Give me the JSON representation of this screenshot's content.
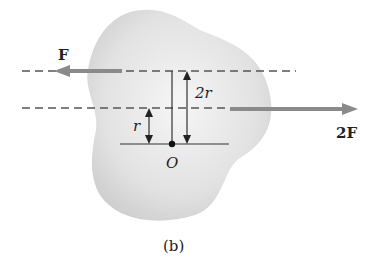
{
  "figure": {
    "caption": "(b)",
    "body": {
      "fill_inner": "#f4f4f4",
      "fill_outer": "#d2d2d2"
    },
    "forces": [
      {
        "label": "F",
        "direction": "left",
        "color": "#8a8a8a"
      },
      {
        "label": "2F",
        "direction": "right",
        "color": "#8a8a8a"
      }
    ],
    "dimensions": [
      {
        "label": "r"
      },
      {
        "label": "2r"
      }
    ],
    "point": {
      "label": "O"
    },
    "line_color": "#333333",
    "dash_color": "#555555"
  }
}
